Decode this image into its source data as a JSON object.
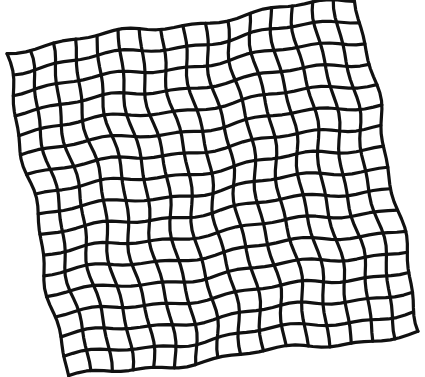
{
  "image": {
    "width": 425,
    "height": 377,
    "background": "#ffffff",
    "description": "Hand-drawn style warped square grid of thick black wavy lines, rotated slightly"
  },
  "grid": {
    "columns": 16,
    "rows": 16,
    "stroke_color": "#111111",
    "stroke_width": 3.2,
    "corners": {
      "top_left": [
        5,
        50
      ],
      "top_right": [
        358,
        -2
      ],
      "bottom_right": [
        421,
        333
      ],
      "bottom_left": [
        66,
        378
      ]
    },
    "wobble": {
      "amplitude": 3.2,
      "frequency_u": 2.3,
      "frequency_v": 1.9,
      "secondary_amplitude": 1.6,
      "secondary_frequency": 5.1
    },
    "samples_per_line": 40
  }
}
